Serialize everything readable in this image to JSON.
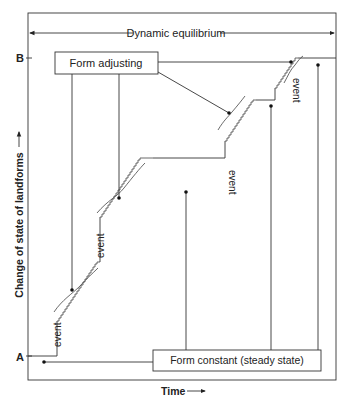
{
  "diagram": {
    "title_band": "Dynamic equilibrium",
    "y_axis_label": "Change of state of landforms",
    "x_axis_label": "Time",
    "levels": {
      "top": "B",
      "bottom": "A"
    },
    "boxes": {
      "adjusting": "Form adjusting",
      "constant": "Form constant (steady state)"
    },
    "event_labels": [
      "event",
      "event",
      "event",
      "event"
    ],
    "colors": {
      "line": "#333333",
      "text": "#222222",
      "background": "#ffffff"
    }
  }
}
